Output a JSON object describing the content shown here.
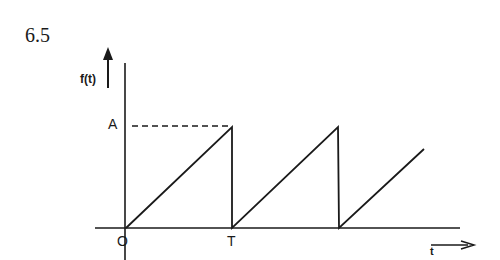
{
  "figure": {
    "number": "6.5",
    "type": "sawtooth waveform",
    "y_axis_label": "f(t)",
    "x_axis_label": "t",
    "amplitude_label": "A",
    "origin_label": "O",
    "period_label": "T"
  },
  "waveform": {
    "shape": "sawtooth",
    "periods_shown": 2.8,
    "rise": "linear from 0 to A over each period T",
    "fall": "instantaneous drop from A to 0 at t = nT",
    "dashed_reference": "horizontal dashed line from A on y-axis to first peak"
  }
}
